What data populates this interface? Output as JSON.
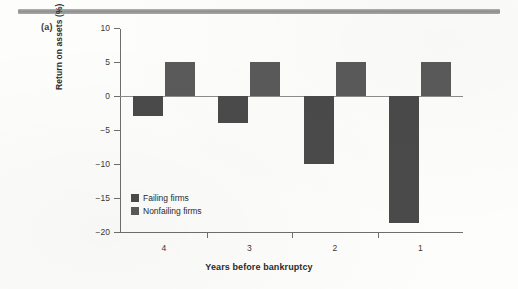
{
  "figure": {
    "panel_label": "(a)",
    "background_color": "#fdfdfb"
  },
  "chart_data": {
    "type": "bar",
    "title": "",
    "xlabel": "Years before bankruptcy",
    "ylabel": "Return on assets (%)",
    "categories": [
      "4",
      "3",
      "2",
      "1"
    ],
    "series": [
      {
        "name": "Failing firms",
        "color": "#4a4a4a",
        "values": [
          -3,
          -4,
          -10,
          -18.7
        ]
      },
      {
        "name": "Nonfailing firms",
        "color": "#5a5a5a",
        "values": [
          5,
          5,
          5,
          5
        ]
      }
    ],
    "ylim": [
      -20,
      10
    ],
    "yticks": [
      10,
      5,
      0,
      -5,
      -10,
      -15,
      -20
    ],
    "ytick_labels": [
      "10",
      "5",
      "0",
      "−5",
      "−10",
      "−15",
      "−20"
    ],
    "grid": false,
    "legend_position": "inside-lower-left",
    "zero_line": true
  },
  "legend": {
    "items": [
      {
        "label": "Failing firms",
        "color": "#4a4a4a"
      },
      {
        "label": "Nonfailing firms",
        "color": "#5a5a5a"
      }
    ]
  }
}
